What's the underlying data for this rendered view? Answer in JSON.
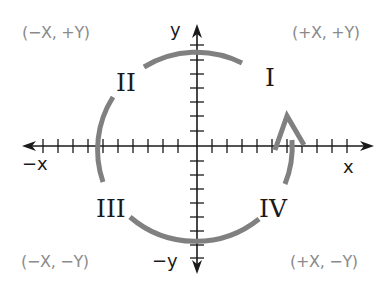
{
  "diagram": {
    "axes": {
      "x_positive_label": "x",
      "x_negative_label": "−x",
      "y_positive_label": "y",
      "y_negative_label": "−y",
      "tick_count_each_side": 10
    },
    "quadrants": [
      {
        "numeral": "I",
        "sign_label": "(+X, +Y)"
      },
      {
        "numeral": "II",
        "sign_label": "(−X, +Y)"
      },
      {
        "numeral": "III",
        "sign_label": "(−X, −Y)"
      },
      {
        "numeral": "IV",
        "sign_label": "(+X, −Y)"
      }
    ],
    "rotation_arrow": {
      "direction": "counterclockwise",
      "color": "#808080"
    },
    "colors": {
      "axis": "#1a1a1a",
      "arc": "#808080",
      "sign_label": "#8a8a8a",
      "numeral": "#1a1a1a"
    }
  }
}
